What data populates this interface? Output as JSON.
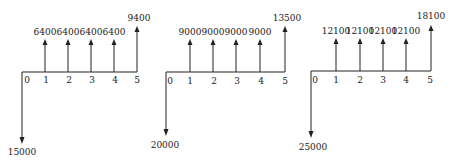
{
  "diagrams": [
    {
      "name": "cash-flow-1",
      "initial_outflow": "15000",
      "periods": [
        "0",
        "1",
        "2",
        "3",
        "4",
        "5"
      ],
      "inflows": [
        "6400",
        "6400",
        "6400",
        "6400"
      ],
      "final_inflow": "9400",
      "axis": {
        "x0": 22,
        "x5": 137,
        "y": 72
      },
      "ticks_x": [
        22,
        45,
        68,
        91,
        114,
        137
      ],
      "up_top": 40,
      "final_top": 27,
      "down_bottom": 143
    },
    {
      "name": "cash-flow-2",
      "initial_outflow": "20000",
      "periods": [
        "0",
        "1",
        "2",
        "3",
        "4",
        "5"
      ],
      "inflows": [
        "9000",
        "9000",
        "9000",
        "9000"
      ],
      "final_inflow": "13500",
      "axis": {
        "x0": 166,
        "x5": 285,
        "y": 72
      },
      "ticks_x": [
        166,
        190,
        213,
        236,
        260,
        285
      ],
      "up_top": 40,
      "final_top": 27,
      "down_bottom": 130
    },
    {
      "name": "cash-flow-3",
      "initial_outflow": "25000",
      "periods": [
        "0",
        "1",
        "2",
        "3",
        "4",
        "5"
      ],
      "inflows": [
        "12100",
        "12100",
        "12100",
        "12100"
      ],
      "final_inflow": "18100",
      "axis": {
        "x0": 311,
        "x5": 431,
        "y": 71
      },
      "ticks_x": [
        311,
        336,
        360,
        383,
        406,
        431
      ],
      "up_top": 39,
      "final_top": 26,
      "down_bottom": 138
    }
  ],
  "colors": {
    "ink": "#222222",
    "background": "#ffffff"
  }
}
